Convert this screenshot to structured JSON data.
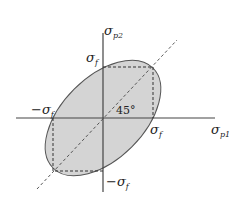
{
  "diagram": {
    "colors": {
      "background": "#ffffff",
      "ellipse_fill": "#d4d4d4",
      "ellipse_stroke": "#555555",
      "axis": "#444444",
      "dashed": "#333333"
    },
    "axes": {
      "horizontal": {
        "symbol": "σ",
        "subscript": "p1"
      },
      "vertical": {
        "symbol": "σ",
        "subscript": "p2"
      }
    },
    "labels": {
      "top_sigma_f": {
        "symbol": "σ",
        "subscript": "f"
      },
      "left_neg_sigma_f": {
        "prefix": "−",
        "symbol": "σ",
        "subscript": "f"
      },
      "right_sigma_f": {
        "symbol": "σ",
        "subscript": "f"
      },
      "bottom_neg_sigma_f": {
        "prefix": "−",
        "symbol": "σ",
        "subscript": "f"
      },
      "angle": "45°"
    },
    "elements": [
      {
        "name": "ellipse",
        "description": "Gray-filled ellipse rotated 45°, centered at origin"
      },
      {
        "name": "dashed-square-upper",
        "description": "Dashed box from (0,σf) to (σf,σf) to (σf,0)"
      },
      {
        "name": "dashed-square-lower",
        "description": "Dashed box from (−σf,0) to (−σf,−σf) to (0,−σf)"
      },
      {
        "name": "diagonal",
        "description": "Dashed 45° line through origin"
      }
    ]
  }
}
